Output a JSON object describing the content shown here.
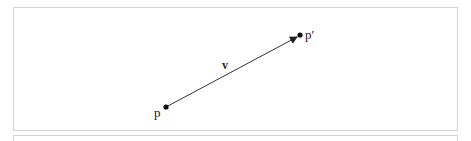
{
  "diagram": {
    "points": [
      {
        "id": "p",
        "label": "p",
        "x": 166,
        "y": 107
      },
      {
        "id": "p_prime",
        "label": "p′",
        "x": 300,
        "y": 35
      }
    ],
    "vector": {
      "label": "v",
      "from": "p",
      "to": "p_prime"
    },
    "colors": {
      "stroke": "#333333",
      "frame": "#d4d4d4"
    }
  }
}
